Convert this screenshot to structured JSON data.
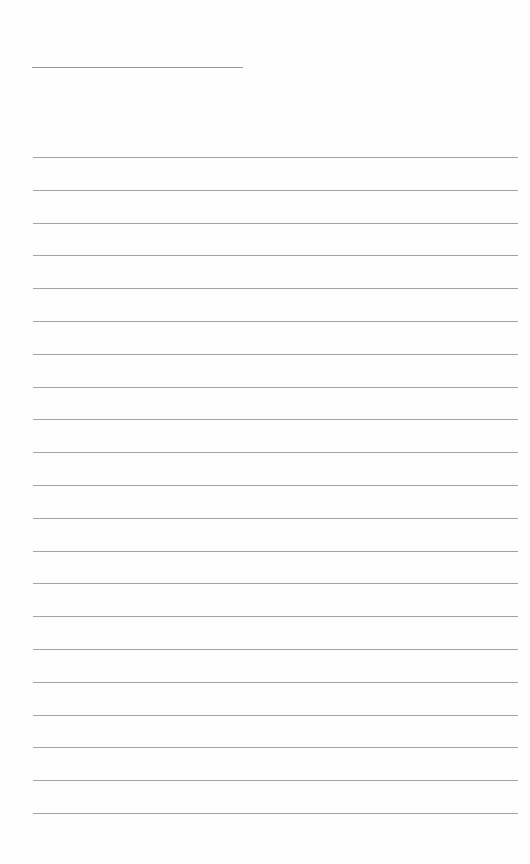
{
  "document": {
    "type": "blank lined writing paper",
    "header_field": {
      "label": "",
      "value": ""
    },
    "ruled_lines": {
      "count": 21,
      "first_y": 157,
      "spacing": 32.8,
      "color": "#a3a3a3"
    },
    "lines": [
      "",
      "",
      "",
      "",
      "",
      "",
      "",
      "",
      "",
      "",
      "",
      "",
      "",
      "",
      "",
      "",
      "",
      "",
      "",
      "",
      ""
    ]
  }
}
